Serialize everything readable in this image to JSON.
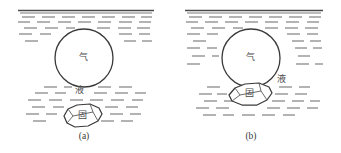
{
  "figure": {
    "type": "schematic-diagram",
    "background_color": "#ffffff",
    "line_color": "#3a3a3a",
    "hatch_color": "#808080",
    "panels": [
      {
        "id": "a",
        "caption": "(a)",
        "state": "detached",
        "bubble": {
          "label": "气",
          "label_meaning": "gas",
          "cx": 82,
          "cy": 58,
          "r": 29
        },
        "liquid": {
          "label": "液",
          "label_meaning": "liquid",
          "label_x": 78,
          "label_y": 92
        },
        "particle": {
          "label": "固",
          "label_meaning": "solid",
          "cx": 80,
          "cy": 117
        },
        "surface_line_y": 11
      },
      {
        "id": "b",
        "caption": "(b)",
        "state": "attached",
        "bubble": {
          "label": "气",
          "label_meaning": "gas",
          "cx": 80,
          "cy": 58,
          "r": 29
        },
        "liquid": {
          "label": "液",
          "label_meaning": "liquid",
          "label_x": 110,
          "label_y": 80
        },
        "particle": {
          "label": "固",
          "label_meaning": "solid",
          "cx": 78,
          "cy": 94
        },
        "surface_line_y": 11
      }
    ]
  }
}
